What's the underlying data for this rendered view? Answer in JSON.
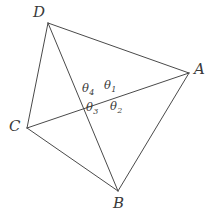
{
  "figure": {
    "stroke_color": "#4a4a4a",
    "text_color": "#3a3a3a",
    "background_color": "#ffffff",
    "stroke_width": 1,
    "width": 212,
    "height": 217
  },
  "vertices": {
    "A": {
      "label": "A",
      "x": 189,
      "y": 73,
      "label_x": 194,
      "label_y": 62
    },
    "B": {
      "label": "B",
      "x": 118,
      "y": 191,
      "label_x": 113,
      "label_y": 196
    },
    "C": {
      "label": "C",
      "x": 27,
      "y": 128,
      "label_x": 9,
      "label_y": 119
    },
    "D": {
      "label": "D",
      "x": 48,
      "y": 23,
      "label_x": 33,
      "label_y": 5
    }
  },
  "intersection": {
    "name": "P",
    "x": 106,
    "y": 99
  },
  "edges": [
    {
      "name": "edge-DA",
      "from": "D",
      "to": "A"
    },
    {
      "name": "edge-AB",
      "from": "A",
      "to": "B"
    },
    {
      "name": "edge-BC",
      "from": "B",
      "to": "C"
    },
    {
      "name": "edge-CD",
      "from": "C",
      "to": "D"
    }
  ],
  "diagonals": [
    {
      "name": "diagonal-DB",
      "from": "D",
      "to": "B"
    },
    {
      "name": "diagonal-CA",
      "from": "C",
      "to": "A"
    }
  ],
  "angles": [
    {
      "name": "theta-1",
      "symbol": "θ",
      "subscript": "1",
      "x": 104,
      "y": 80,
      "position": "top-right"
    },
    {
      "name": "theta-2",
      "symbol": "θ",
      "subscript": "2",
      "x": 110,
      "y": 101,
      "position": "bottom-right"
    },
    {
      "name": "theta-3",
      "symbol": "θ",
      "subscript": "3",
      "x": 86,
      "y": 102,
      "position": "bottom-left"
    },
    {
      "name": "theta-4",
      "symbol": "θ",
      "subscript": "4",
      "x": 82,
      "y": 83,
      "position": "top-left"
    }
  ]
}
